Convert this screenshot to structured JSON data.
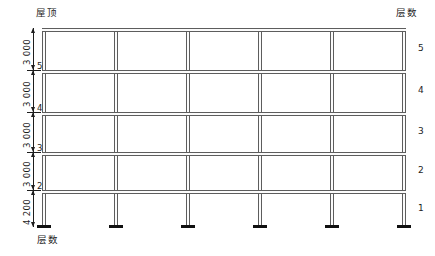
{
  "diagram": {
    "title_roof_label": "屋顶",
    "floor_count_label_right": "层数",
    "floor_count_label_left": "层数",
    "colors": {
      "line": "#5d5d5d",
      "text": "#1d1d1d",
      "base": "#101010"
    },
    "structure": {
      "type": "moment-frame-elevation",
      "stories": 5,
      "bays": 5,
      "columns": 6,
      "beam_levels": 5,
      "support": "fixed-base"
    },
    "story_heights": [
      {
        "level_marker": "5",
        "dimension": "3 000"
      },
      {
        "level_marker": "4",
        "dimension": "3 000"
      },
      {
        "level_marker": "3",
        "dimension": "3 000"
      },
      {
        "level_marker": "2",
        "dimension": "3 000"
      },
      {
        "level_marker": "",
        "dimension": "4 200"
      }
    ],
    "floor_numbers_right": [
      "5",
      "4",
      "3",
      "2",
      "1"
    ]
  }
}
